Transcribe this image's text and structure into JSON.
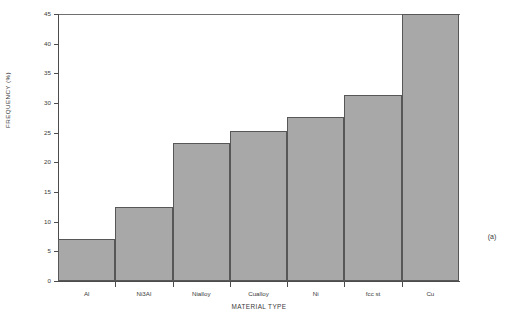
{
  "figure": {
    "panel_tag": "(a)"
  },
  "chart_data": {
    "type": "bar",
    "title": "",
    "xlabel": "MATERIAL TYPE",
    "ylabel": "FREQUENCY (%)",
    "categories": [
      "Al",
      "Ni3Al",
      "Nialloy",
      "Cualloy",
      "Ni",
      "fcc st",
      "Cu"
    ],
    "values": [
      7.0,
      12.4,
      23.3,
      25.3,
      27.6,
      31.4,
      45.0
    ],
    "clipped_bars": [
      "Cu"
    ],
    "ylim": [
      0,
      45
    ],
    "yticks": [
      0,
      5,
      10,
      15,
      20,
      25,
      30,
      35,
      40,
      45
    ],
    "ytick_labels": [
      "0",
      "5",
      "10",
      "15",
      "20",
      "25",
      "30",
      "35",
      "40",
      "45"
    ],
    "grid": false,
    "legend": null,
    "bar_fill_color": "#a8a8a8",
    "bar_edge_color": "#575757",
    "axis_color": "#4c4c4c",
    "background_color": "#ffffff"
  }
}
